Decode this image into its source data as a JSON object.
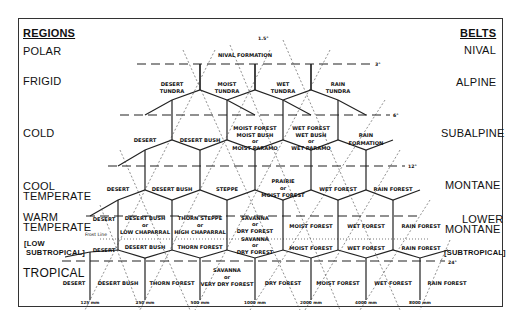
{
  "regions": {
    "header": "REGIONS",
    "items": [
      "POLAR",
      "FRIGID",
      "COLD",
      "COOL",
      "TEMPERATE",
      "WARM",
      "TEMPERATE",
      "[LOW",
      "SUBTROPICAL]",
      "TROPICAL"
    ]
  },
  "belts": {
    "header": "BELTS",
    "items": [
      "NIVAL",
      "ALPINE",
      "SUBALPINE",
      "MONTANE",
      "LOWER",
      "MONTANE",
      "[SUBTROPICAL]"
    ]
  },
  "zones": {
    "nival": "NIVAL FORMATION",
    "alpine": [
      [
        "DESERT",
        "TUNDRA"
      ],
      [
        "MOIST",
        "TUNDRA"
      ],
      [
        "WET",
        "TUNDRA"
      ],
      [
        "RAIN",
        "TUNDRA"
      ]
    ],
    "subalpine": [
      [
        "DESERT"
      ],
      [
        "DESERT BUSH"
      ],
      [
        "MOIST FOREST",
        "MOIST BUSH",
        "or",
        "MOIST PARAMO"
      ],
      [
        "WET FOREST",
        "WET BUSH",
        "or",
        "WET PARAMO"
      ],
      [
        "RAIN",
        "FORMATION"
      ]
    ],
    "montane": [
      [
        "DESERT"
      ],
      [
        "DESERT BUSH"
      ],
      [
        "STEPPE"
      ],
      [
        "PRAIRIE",
        "or",
        "MOIST FOREST"
      ],
      [
        "WET FOREST"
      ],
      [
        "RAIN FOREST"
      ]
    ],
    "lower_montane": [
      [
        "DESERT"
      ],
      [
        "DESERT BUSH",
        "or",
        "LOW CHAPARRAL"
      ],
      [
        "THORN STEPPE",
        "or",
        "HIGH CHAPARRAL"
      ],
      [
        "SAVANNA",
        "or",
        "DRY FOREST"
      ],
      [
        "MOIST FOREST"
      ],
      [
        "WET FOREST"
      ],
      [
        "RAIN FOREST"
      ]
    ],
    "subtropical": [
      [
        "DESERT"
      ],
      [
        "DESERT BUSH"
      ],
      [
        "THORN FOREST"
      ],
      [
        "SAVANNA",
        "or",
        "DRY FOREST"
      ],
      [
        "MOIST FOREST"
      ],
      [
        "WET FOREST"
      ],
      [
        "RAIN FOREST"
      ]
    ],
    "tropical": [
      [
        "DESERT"
      ],
      [
        "DESERT BUSH"
      ],
      [
        "THORN FOREST"
      ],
      [
        "SAVANNA",
        "or",
        "VERY DRY FOREST"
      ],
      [
        "DRY FOREST"
      ],
      [
        "MOIST FOREST"
      ],
      [
        "WET FOREST"
      ],
      [
        "RAIN FOREST"
      ]
    ]
  },
  "frost_line": "Frost Line",
  "temperatures": [
    "1.5°",
    "3°",
    "6°",
    "12°",
    "24°"
  ],
  "precipitation": [
    "125 mm",
    "250 mm",
    "500 mm",
    "1000 mm",
    "2000 mm",
    "4000 mm",
    "8000 mm"
  ],
  "colors": {
    "line": "#222222",
    "background": "#ffffff"
  }
}
